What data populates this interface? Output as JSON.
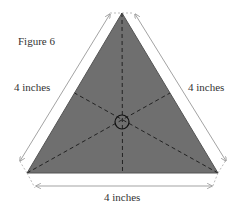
{
  "figure": {
    "title": "Figure 6",
    "shape": "equilateral-triangle",
    "side_labels": {
      "left": "4 inches",
      "right": "4 inches",
      "bottom": "4 inches"
    },
    "colors": {
      "fill": "#6f6f6f",
      "dash": "#222222",
      "dimension_line": "#999999",
      "text": "#333333"
    }
  }
}
